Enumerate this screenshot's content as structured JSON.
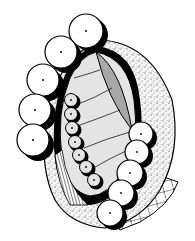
{
  "figure": {
    "type": "scientific-illustration",
    "colors": {
      "background": "#ffffff",
      "ink": "#000000",
      "light_fill": "#e4e4e4",
      "mid_fill": "#a8a8a8",
      "stipple_base": "#f4f4f4"
    },
    "large_circles_left": [
      {
        "cx": 86,
        "cy": 31,
        "r": 17
      },
      {
        "cx": 61,
        "cy": 52,
        "r": 16
      },
      {
        "cx": 43,
        "cy": 80,
        "r": 16
      },
      {
        "cx": 35,
        "cy": 110,
        "r": 16
      },
      {
        "cx": 33,
        "cy": 140,
        "r": 16
      }
    ],
    "small_circles_inner": [
      {
        "cx": 71,
        "cy": 100,
        "r": 7
      },
      {
        "cx": 71,
        "cy": 114,
        "r": 7
      },
      {
        "cx": 72,
        "cy": 128,
        "r": 7
      },
      {
        "cx": 75,
        "cy": 142,
        "r": 7
      },
      {
        "cx": 79,
        "cy": 155,
        "r": 7
      },
      {
        "cx": 86,
        "cy": 167,
        "r": 7
      },
      {
        "cx": 94,
        "cy": 180,
        "r": 7
      }
    ],
    "large_circles_right": [
      {
        "cx": 141,
        "cy": 134,
        "r": 12
      },
      {
        "cx": 137,
        "cy": 152,
        "r": 12
      },
      {
        "cx": 130,
        "cy": 173,
        "r": 13
      },
      {
        "cx": 121,
        "cy": 193,
        "r": 13
      },
      {
        "cx": 110,
        "cy": 213,
        "r": 13
      }
    ]
  }
}
